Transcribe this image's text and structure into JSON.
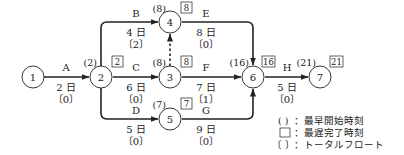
{
  "diagram": {
    "type": "arrow-diagram (activity-on-arrow network)",
    "nodes": [
      {
        "id": "1",
        "label": "1",
        "earliest_start": "",
        "latest_finish": ""
      },
      {
        "id": "2",
        "label": "2",
        "earliest_start": "(2)",
        "latest_finish": "2"
      },
      {
        "id": "3",
        "label": "3",
        "earliest_start": "(8)",
        "latest_finish": "8"
      },
      {
        "id": "4",
        "label": "4",
        "earliest_start": "(8)",
        "latest_finish": "8"
      },
      {
        "id": "5",
        "label": "5",
        "earliest_start": "(7)",
        "latest_finish": "7"
      },
      {
        "id": "6",
        "label": "6",
        "earliest_start": "(16)",
        "latest_finish": "16"
      },
      {
        "id": "7",
        "label": "7",
        "earliest_start": "(21)",
        "latest_finish": "21"
      }
    ],
    "activities": [
      {
        "name": "A",
        "from": "1",
        "to": "2",
        "duration": "2 日",
        "float": "〔0〕"
      },
      {
        "name": "B",
        "from": "2",
        "to": "4",
        "duration": "4 日",
        "float": "〔2〕"
      },
      {
        "name": "C",
        "from": "2",
        "to": "3",
        "duration": "6 日",
        "float": "〔0〕"
      },
      {
        "name": "D",
        "from": "2",
        "to": "5",
        "duration": "5 日",
        "float": "〔0〕"
      },
      {
        "name": "E",
        "from": "4",
        "to": "6",
        "duration": "8 日",
        "float": "〔0〕"
      },
      {
        "name": "F",
        "from": "3",
        "to": "6",
        "duration": "7 日",
        "float": "〔1〕"
      },
      {
        "name": "G",
        "from": "5",
        "to": "6",
        "duration": "9 日",
        "float": "〔0〕"
      },
      {
        "name": "H",
        "from": "6",
        "to": "7",
        "duration": "5 日",
        "float": "〔0〕"
      }
    ],
    "dummy": {
      "from": "3",
      "to": "4",
      "style": "dashed"
    }
  },
  "legend": {
    "items": [
      {
        "symbol": "(  )",
        "text": "：最早開始時刻"
      },
      {
        "symbol": "□",
        "text": "：最遅完了時刻"
      },
      {
        "symbol": "〔  〕",
        "text": "：トータルフロート"
      }
    ]
  }
}
